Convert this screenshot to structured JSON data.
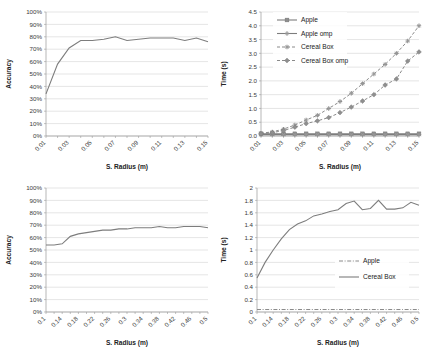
{
  "figure": {
    "background_color": "#ffffff",
    "line_color": "#7d7d7d",
    "grid_color": "#d4d4d4",
    "panel_count": 4
  },
  "chart_data": [
    {
      "id": "top-left",
      "type": "line",
      "title": "",
      "xlabel": "S. Radius (m)",
      "ylabel": "Accuracy",
      "xlim": [
        0.01,
        0.15
      ],
      "ylim": [
        0,
        100
      ],
      "grid": true,
      "legend": null,
      "xtick_labels": [
        "0.01",
        "0.03",
        "0.05",
        "0.07",
        "0.09",
        "0.11",
        "0.13",
        "0.15"
      ],
      "ytick_labels": [
        "0%",
        "10%",
        "20%",
        "30%",
        "40%",
        "50%",
        "60%",
        "70%",
        "80%",
        "90%",
        "100%"
      ],
      "x": [
        0.01,
        0.02,
        0.03,
        0.04,
        0.05,
        0.06,
        0.07,
        0.08,
        0.09,
        0.1,
        0.11,
        0.12,
        0.13,
        0.14,
        0.15
      ],
      "series": [
        {
          "name": "Accuracy",
          "style": "solid",
          "marker": "none",
          "values": [
            34,
            58,
            71,
            77,
            77,
            78,
            80,
            77,
            78,
            79,
            79,
            79,
            77,
            79,
            76
          ]
        }
      ]
    },
    {
      "id": "top-right",
      "type": "line",
      "title": "",
      "xlabel": "S. Radius (m)",
      "ylabel": "Time (s)",
      "xlim": [
        0.01,
        0.15
      ],
      "ylim": [
        0.0,
        4.5
      ],
      "grid": true,
      "legend": "upper-left",
      "xtick_labels": [
        "0.01",
        "0.03",
        "0.05",
        "0.07",
        "0.09",
        "0.11",
        "0.13",
        "0.15"
      ],
      "ytick_labels": [
        "0.0",
        "0.5",
        "1.0",
        "1.5",
        "2.0",
        "2.5",
        "3.0",
        "3.5",
        "4.0",
        "4.5"
      ],
      "x": [
        0.01,
        0.02,
        0.03,
        0.04,
        0.05,
        0.06,
        0.07,
        0.08,
        0.09,
        0.1,
        0.11,
        0.12,
        0.13,
        0.14,
        0.15
      ],
      "series": [
        {
          "name": "Apple",
          "style": "solid",
          "marker": "square",
          "values": [
            0.08,
            0.08,
            0.08,
            0.08,
            0.08,
            0.08,
            0.08,
            0.08,
            0.08,
            0.08,
            0.08,
            0.08,
            0.08,
            0.08,
            0.08
          ]
        },
        {
          "name": "Apple omp",
          "style": "solid",
          "marker": "cross",
          "values": [
            0.05,
            0.05,
            0.05,
            0.05,
            0.05,
            0.05,
            0.05,
            0.05,
            0.05,
            0.05,
            0.05,
            0.05,
            0.05,
            0.05,
            0.05
          ]
        },
        {
          "name": "Cereal Box",
          "style": "dashed",
          "marker": "cross",
          "values": [
            0.1,
            0.15,
            0.25,
            0.4,
            0.58,
            0.75,
            1.0,
            1.25,
            1.55,
            1.9,
            2.25,
            2.6,
            3.0,
            3.45,
            4.0
          ]
        },
        {
          "name": "Cereal Box omp",
          "style": "dashed",
          "marker": "diamond",
          "values": [
            0.08,
            0.12,
            0.2,
            0.32,
            0.45,
            0.55,
            0.67,
            0.85,
            1.05,
            1.27,
            1.5,
            1.85,
            2.07,
            2.72,
            3.05
          ]
        }
      ]
    },
    {
      "id": "bottom-left",
      "type": "line",
      "title": "",
      "xlabel": "S. Radius (m)",
      "ylabel": "Accuracy",
      "xlim": [
        0.1,
        0.5
      ],
      "ylim": [
        0,
        100
      ],
      "grid": true,
      "legend": null,
      "xtick_labels": [
        "0.1",
        "0.14",
        "0.18",
        "0.22",
        "0.26",
        "0.3",
        "0.34",
        "0.38",
        "0.42",
        "0.46",
        "0.5"
      ],
      "ytick_labels": [
        "0%",
        "10%",
        "20%",
        "30%",
        "40%",
        "50%",
        "60%",
        "70%",
        "80%",
        "90%",
        "100%"
      ],
      "x": [
        0.1,
        0.12,
        0.14,
        0.16,
        0.18,
        0.2,
        0.22,
        0.24,
        0.26,
        0.28,
        0.3,
        0.32,
        0.34,
        0.36,
        0.38,
        0.4,
        0.42,
        0.44,
        0.46,
        0.48,
        0.5
      ],
      "series": [
        {
          "name": "Accuracy",
          "style": "solid",
          "marker": "none",
          "values": [
            54,
            54,
            55,
            61,
            63,
            64,
            65,
            66,
            66,
            67,
            67,
            68,
            68,
            68,
            69,
            68,
            68,
            69,
            69,
            69,
            68
          ]
        }
      ]
    },
    {
      "id": "bottom-right",
      "type": "line",
      "title": "",
      "xlabel": "S. Radius (m)",
      "ylabel": "Time (s)",
      "xlim": [
        0.1,
        0.5
      ],
      "ylim": [
        0,
        2
      ],
      "grid": true,
      "legend": "center-right",
      "xtick_labels": [
        "0.1",
        "0.14",
        "0.18",
        "0.22",
        "0.26",
        "0.3",
        "0.34",
        "0.38",
        "0.42",
        "0.46",
        "0.5"
      ],
      "ytick_labels": [
        "0",
        "0.2",
        "0.4",
        "0.6",
        "0.8",
        "1",
        "1.2",
        "1.4",
        "1.6",
        "1.8",
        "2"
      ],
      "x": [
        0.1,
        0.12,
        0.14,
        0.16,
        0.18,
        0.2,
        0.22,
        0.24,
        0.26,
        0.28,
        0.3,
        0.32,
        0.34,
        0.36,
        0.38,
        0.4,
        0.42,
        0.44,
        0.46,
        0.48,
        0.5
      ],
      "series": [
        {
          "name": "Apple",
          "style": "dashdot",
          "marker": "none",
          "values": [
            0.04,
            0.04,
            0.04,
            0.04,
            0.04,
            0.04,
            0.04,
            0.04,
            0.04,
            0.04,
            0.04,
            0.04,
            0.04,
            0.04,
            0.04,
            0.04,
            0.04,
            0.04,
            0.04,
            0.04,
            0.04
          ]
        },
        {
          "name": "Cereal Box",
          "style": "solid",
          "marker": "none",
          "values": [
            0.55,
            0.8,
            1.0,
            1.18,
            1.33,
            1.42,
            1.47,
            1.55,
            1.58,
            1.62,
            1.65,
            1.75,
            1.79,
            1.65,
            1.67,
            1.8,
            1.66,
            1.66,
            1.68,
            1.77,
            1.72
          ]
        }
      ]
    }
  ]
}
